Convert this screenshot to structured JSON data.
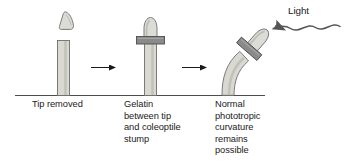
{
  "figure": {
    "background_color": "#ffffff",
    "ground_line_color": "#4d4d4d",
    "stem_fill": "#d9d9d2",
    "stem_stroke": "#6e6e6e",
    "tip_fill": "#dcdcd6",
    "tip_stroke": "#6e6e6e",
    "gelatin_fill": "#8a8a8a",
    "gelatin_stroke": "#4d4d4d",
    "arrow_color": "#1a1a1a",
    "light_wave_color": "#555555",
    "text_color": "#1a1a1a"
  },
  "panels": [
    {
      "id": "panel-tip-removed",
      "index": 1,
      "caption": "Tip removed",
      "elements": [
        "coleoptile-stump",
        "severed-tip"
      ]
    },
    {
      "id": "panel-gelatin",
      "index": 2,
      "caption": "Gelatin\nbetween tip\nand coleoptile\nstump",
      "elements": [
        "coleoptile-stump",
        "gelatin-block",
        "reattached-tip"
      ]
    },
    {
      "id": "panel-curvature",
      "index": 3,
      "caption": "Normal\nphototropic\ncurvature\nremains\npossible",
      "elements": [
        "curved-coleoptile",
        "gelatin-block",
        "reattached-tip"
      ]
    }
  ],
  "arrows": [
    {
      "id": "arrow-1",
      "from_panel": 1,
      "to_panel": 2,
      "label": ""
    },
    {
      "id": "arrow-2",
      "from_panel": 2,
      "to_panel": 3,
      "label": ""
    }
  ],
  "light": {
    "label": "Light",
    "direction": "right-to-left",
    "arrow_points_to": "coleoptile-tip",
    "style": "wavy-ray"
  }
}
